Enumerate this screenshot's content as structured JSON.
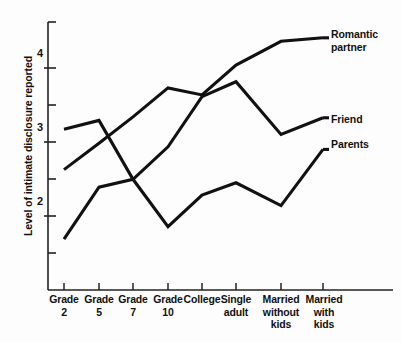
{
  "chart_data": {
    "type": "line",
    "title": "",
    "xlabel": "",
    "ylabel": "Level of intimate disclosure reported",
    "categories": [
      "Grade 2",
      "Grade 5",
      "Grade 7",
      "Grade 10",
      "College",
      "Single adult",
      "Married without kids",
      "Married with kids"
    ],
    "category_lines": [
      [
        "Grade",
        "2"
      ],
      [
        "Grade",
        "5"
      ],
      [
        "Grade",
        "7"
      ],
      [
        "Grade",
        "10"
      ],
      [
        "College",
        ""
      ],
      [
        "Single",
        "adult"
      ],
      [
        "Married",
        "without",
        "kids"
      ],
      [
        "Married",
        "with",
        "kids"
      ]
    ],
    "ylim": [
      1.5,
      4.55
    ],
    "ytick_values": [
      2,
      3,
      4
    ],
    "ytick_labels": [
      "2",
      "3",
      "4"
    ],
    "yminor_values": [
      1.5,
      2.5,
      3.5,
      4.5
    ],
    "grid": false,
    "legend_position": "right-inline",
    "series": [
      {
        "name": "Romantic partner",
        "label_lines": [
          "Romantic",
          "partner"
        ],
        "color": "#111111",
        "values": [
          2.87,
          3.17,
          3.47,
          3.8,
          3.72,
          4.06,
          4.33,
          4.37
        ]
      },
      {
        "name": "Friend",
        "label_lines": [
          "Friend"
        ],
        "color": "#111111",
        "values": [
          2.08,
          2.67,
          2.76,
          3.13,
          3.7,
          3.87,
          3.27,
          3.46
        ]
      },
      {
        "name": "Parents",
        "label_lines": [
          "Parents"
        ],
        "color": "#111111",
        "values": [
          3.33,
          3.43,
          2.76,
          2.22,
          2.58,
          2.72,
          2.46,
          3.1
        ]
      }
    ]
  },
  "axis": {
    "y_title": "Level of intimate disclosure reported",
    "ytick_0": "2",
    "ytick_1": "3",
    "ytick_2": "4"
  },
  "xlabels": {
    "c0_l0": "Grade",
    "c0_l1": "2",
    "c1_l0": "Grade",
    "c1_l1": "5",
    "c2_l0": "Grade",
    "c2_l1": "7",
    "c3_l0": "Grade",
    "c3_l1": "10",
    "c4_l0": "College",
    "c5_l0": "Single",
    "c5_l1": "adult",
    "c6_l0": "Married",
    "c6_l1": "without",
    "c6_l2": "kids",
    "c7_l0": "Married",
    "c7_l1": "with",
    "c7_l2": "kids"
  },
  "legend": {
    "romantic_l0": "Romantic",
    "romantic_l1": "partner",
    "friend_l0": "Friend",
    "parents_l0": "Parents"
  }
}
